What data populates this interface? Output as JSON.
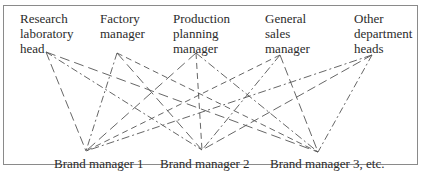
{
  "diagram": {
    "type": "organizational-relationship-network",
    "top_nodes": [
      {
        "id": "research",
        "lines": [
          "Research",
          "laboratory",
          "head"
        ],
        "left": 20,
        "anchor": [
          46,
          52
        ]
      },
      {
        "id": "factory",
        "lines": [
          "Factory",
          "manager"
        ],
        "left": 100,
        "anchor": [
          117,
          53
        ]
      },
      {
        "id": "production",
        "lines": [
          "Production",
          "planning",
          "manager"
        ],
        "left": 173,
        "anchor": [
          196,
          53
        ]
      },
      {
        "id": "sales",
        "lines": [
          "General",
          "sales",
          "manager"
        ],
        "left": 265,
        "anchor": [
          280,
          55
        ]
      },
      {
        "id": "other",
        "lines": [
          "Other",
          "department",
          "heads"
        ],
        "left": 354,
        "anchor": [
          372,
          55
        ]
      }
    ],
    "bottom_nodes": [
      {
        "id": "brand1",
        "label": "Brand manager 1",
        "left": 54,
        "anchor": [
          86,
          151
        ]
      },
      {
        "id": "brand2",
        "label": "Brand manager 2",
        "left": 160,
        "anchor": [
          202,
          150
        ]
      },
      {
        "id": "brand3",
        "label": "Brand manager 3, etc.",
        "left": 270,
        "anchor": [
          318,
          152
        ]
      }
    ],
    "connections": "every top node connected to every bottom node with dashed lines",
    "colors": {
      "frame": "#8a8a8a",
      "line": "#555555",
      "text": "#2b2b2b"
    }
  }
}
